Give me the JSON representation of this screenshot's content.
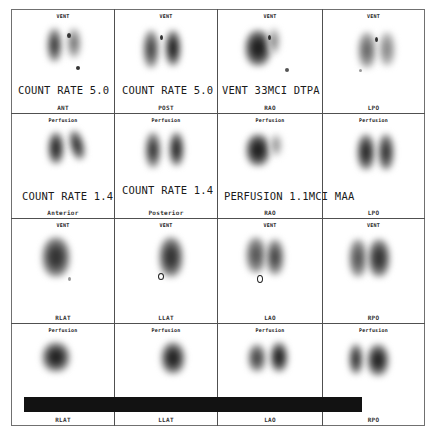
{
  "study": {
    "title": "V/Q Lung Scan",
    "footer_text": "",
    "redaction_bar": true
  },
  "grid": {
    "rows": 4,
    "cols": 4
  },
  "cells": [
    {
      "row": 0,
      "col": 0,
      "top_label": "VENT",
      "bottom_label": "ANT",
      "overlay": "COUNT RATE 5.0"
    },
    {
      "row": 0,
      "col": 1,
      "top_label": "VENT",
      "bottom_label": "POST",
      "overlay": "COUNT RATE 5.0"
    },
    {
      "row": 0,
      "col": 2,
      "top_label": "VENT",
      "bottom_label": "RAO",
      "overlay": "VENT 33MCI DTPA"
    },
    {
      "row": 0,
      "col": 3,
      "top_label": "VENT",
      "bottom_label": "LPO",
      "overlay": ""
    },
    {
      "row": 1,
      "col": 0,
      "top_label": "Perfusion",
      "bottom_label": "Anterior",
      "overlay": "COUNT RATE 1.4"
    },
    {
      "row": 1,
      "col": 1,
      "top_label": "Perfusion",
      "bottom_label": "Posterior",
      "overlay": "COUNT RATE 1.4"
    },
    {
      "row": 1,
      "col": 2,
      "top_label": "Perfusion",
      "bottom_label": "RAO",
      "overlay": "PERFUSION 1.1MCI MAA"
    },
    {
      "row": 1,
      "col": 3,
      "top_label": "Perfusion",
      "bottom_label": "LPO",
      "overlay": ""
    },
    {
      "row": 2,
      "col": 0,
      "top_label": "VENT",
      "bottom_label": "RLAT",
      "overlay": ""
    },
    {
      "row": 2,
      "col": 1,
      "top_label": "VENT",
      "bottom_label": "LLAT",
      "overlay": ""
    },
    {
      "row": 2,
      "col": 2,
      "top_label": "VENT",
      "bottom_label": "LAO",
      "overlay": ""
    },
    {
      "row": 2,
      "col": 3,
      "top_label": "VENT",
      "bottom_label": "RPO",
      "overlay": ""
    },
    {
      "row": 3,
      "col": 0,
      "top_label": "Perfusion",
      "bottom_label": "RLAT",
      "overlay": ""
    },
    {
      "row": 3,
      "col": 1,
      "top_label": "Perfusion",
      "bottom_label": "LLAT",
      "overlay": ""
    },
    {
      "row": 3,
      "col": 2,
      "top_label": "Perfusion",
      "bottom_label": "LAO",
      "overlay": ""
    },
    {
      "row": 3,
      "col": 3,
      "top_label": "Perfusion",
      "bottom_label": "RPO",
      "overlay": ""
    }
  ],
  "colors": {
    "background": "#ffffff",
    "grid_line": "#505050",
    "uptake_dark": "#2a2a2a",
    "redaction": "#121212"
  }
}
